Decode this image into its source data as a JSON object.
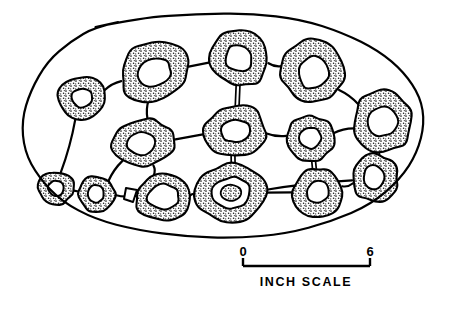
{
  "figure": {
    "outline_name": "specimen-outline",
    "stroke_color": "#000000",
    "fill_color": "#ffffff",
    "stipple_color": "#1a1a1a",
    "background": "#ffffff"
  },
  "scale": {
    "start_label": "0",
    "end_label": "6",
    "caption": "INCH  SCALE",
    "units": "inch",
    "min": 0,
    "max": 6
  },
  "chart_data": {
    "type": "scatter",
    "xlabel": "",
    "ylabel": "",
    "scale_units": "inch",
    "scale_min": 0,
    "scale_max": 6,
    "legend": [],
    "grid": false,
    "outline": [
      [
        96,
        28
      ],
      [
        140,
        18
      ],
      [
        196,
        13
      ],
      [
        252,
        14
      ],
      [
        300,
        20
      ],
      [
        344,
        32
      ],
      [
        378,
        50
      ],
      [
        404,
        72
      ],
      [
        420,
        98
      ],
      [
        424,
        124
      ],
      [
        418,
        152
      ],
      [
        400,
        180
      ],
      [
        372,
        204
      ],
      [
        332,
        222
      ],
      [
        286,
        233
      ],
      [
        236,
        238
      ],
      [
        186,
        237
      ],
      [
        138,
        231
      ],
      [
        96,
        220
      ],
      [
        62,
        202
      ],
      [
        38,
        178
      ],
      [
        25,
        150
      ],
      [
        22,
        120
      ],
      [
        30,
        90
      ],
      [
        48,
        62
      ],
      [
        70,
        42
      ]
    ],
    "rings": [
      {
        "id": "ring-nw-small",
        "cx": 82,
        "cy": 98,
        "rx": 25,
        "ry": 23,
        "hole_rx": 11,
        "hole_ry": 10,
        "rot": -8,
        "hole_dx": 0,
        "hole_dy": 0
      },
      {
        "id": "ring-n-left",
        "cx": 154,
        "cy": 71,
        "rx": 36,
        "ry": 30,
        "hole_rx": 18,
        "hole_ry": 14,
        "rot": -18,
        "hole_dx": 0,
        "hole_dy": 2
      },
      {
        "id": "ring-n-center",
        "cx": 240,
        "cy": 58,
        "rx": 30,
        "ry": 29,
        "hole_rx": 14,
        "hole_ry": 14,
        "rot": 10,
        "hole_dx": -1,
        "hole_dy": 0
      },
      {
        "id": "ring-n-right",
        "cx": 313,
        "cy": 72,
        "rx": 33,
        "ry": 32,
        "hole_rx": 15,
        "hole_ry": 17,
        "rot": 12,
        "hole_dx": 1,
        "hole_dy": 1
      },
      {
        "id": "ring-e-upper",
        "cx": 383,
        "cy": 122,
        "rx": 31,
        "ry": 31,
        "hole_rx": 15,
        "hole_ry": 15,
        "rot": 0,
        "hole_dx": 0,
        "hole_dy": 0
      },
      {
        "id": "ring-mid-left",
        "cx": 143,
        "cy": 143,
        "rx": 31,
        "ry": 25,
        "hole_rx": 14,
        "hole_ry": 12,
        "rot": -6,
        "hole_dx": -2,
        "hole_dy": 0
      },
      {
        "id": "ring-mid-center",
        "cx": 235,
        "cy": 131,
        "rx": 32,
        "ry": 25,
        "hole_rx": 15,
        "hole_ry": 11,
        "rot": -8,
        "hole_dx": 0,
        "hole_dy": 0
      },
      {
        "id": "ring-mid-right",
        "cx": 310,
        "cy": 138,
        "rx": 25,
        "ry": 23,
        "hole_rx": 12,
        "hole_ry": 11,
        "rot": 0,
        "hole_dx": 0,
        "hole_dy": 0
      },
      {
        "id": "ring-e-lower",
        "cx": 375,
        "cy": 178,
        "rx": 24,
        "ry": 24,
        "hole_rx": 11,
        "hole_ry": 12,
        "rot": 0,
        "hole_dx": -1,
        "hole_dy": -1
      },
      {
        "id": "ring-sw-tiny",
        "cx": 56,
        "cy": 188,
        "rx": 18,
        "ry": 17,
        "hole_rx": 8,
        "hole_ry": 8,
        "rot": 0,
        "hole_dx": 0,
        "hole_dy": 0
      },
      {
        "id": "ring-sw-small",
        "cx": 96,
        "cy": 194,
        "rx": 19,
        "ry": 18,
        "hole_rx": 8,
        "hole_ry": 9,
        "rot": 0,
        "hole_dx": 0,
        "hole_dy": 0
      },
      {
        "id": "ring-s-left",
        "cx": 163,
        "cy": 197,
        "rx": 28,
        "ry": 24,
        "hole_rx": 16,
        "hole_ry": 13,
        "rot": -5,
        "hole_dx": 0,
        "hole_dy": 0
      },
      {
        "id": "ring-s-center",
        "cx": 231,
        "cy": 193,
        "rx": 35,
        "ry": 30,
        "hole_rx": 20,
        "hole_ry": 16,
        "rot": -4,
        "hole_dx": 0,
        "hole_dy": 0,
        "double": true,
        "core_rx": 11,
        "core_ry": 8
      },
      {
        "id": "ring-s-right",
        "cx": 318,
        "cy": 192,
        "rx": 26,
        "ry": 25,
        "hole_rx": 12,
        "hole_ry": 11,
        "rot": 0,
        "hole_dx": 0,
        "hole_dy": 0
      },
      {
        "id": "ring-se-small",
        "cx": 300,
        "cy": 139,
        "rx": 0,
        "ry": 0,
        "hole_rx": 0,
        "hole_ry": 0,
        "rot": 0,
        "hole_dx": 0,
        "hole_dy": 0,
        "skip": true
      }
    ],
    "connections": [
      {
        "from": "ring-nw-small",
        "to": "ring-n-left",
        "kind": "single"
      },
      {
        "from": "ring-n-left",
        "to": "ring-n-center",
        "kind": "single"
      },
      {
        "from": "ring-n-center",
        "to": "ring-n-right",
        "kind": "single"
      },
      {
        "from": "ring-n-right",
        "to": "ring-e-upper",
        "kind": "single"
      },
      {
        "from": "ring-n-center",
        "to": "ring-mid-center",
        "kind": "double"
      },
      {
        "from": "ring-n-left",
        "to": "ring-mid-left",
        "kind": "single"
      },
      {
        "from": "ring-nw-small",
        "to": "ring-sw-tiny",
        "kind": "single"
      },
      {
        "from": "ring-mid-left",
        "to": "ring-mid-center",
        "kind": "single"
      },
      {
        "from": "ring-mid-left",
        "to": "ring-sw-small",
        "kind": "single"
      },
      {
        "from": "ring-mid-left",
        "to": "ring-s-left",
        "kind": "single"
      },
      {
        "from": "ring-sw-tiny",
        "to": "ring-sw-small",
        "kind": "single"
      },
      {
        "from": "ring-sw-small",
        "to": "ring-s-left",
        "kind": "single"
      },
      {
        "from": "ring-s-left",
        "to": "ring-s-center",
        "kind": "single"
      },
      {
        "from": "ring-mid-center",
        "to": "ring-s-center",
        "kind": "double"
      },
      {
        "from": "ring-mid-center",
        "to": "ring-mid-right",
        "kind": "single"
      },
      {
        "from": "ring-mid-right",
        "to": "ring-e-upper",
        "kind": "single"
      },
      {
        "from": "ring-mid-right",
        "to": "ring-s-right",
        "kind": "double"
      },
      {
        "from": "ring-e-upper",
        "to": "ring-e-lower",
        "kind": "double"
      },
      {
        "from": "ring-s-center",
        "to": "ring-e-lower",
        "kind": "single"
      },
      {
        "from": "ring-s-center",
        "to": "ring-s-right",
        "kind": "single"
      },
      {
        "from": "ring-s-right",
        "to": "ring-e-lower",
        "kind": "single"
      }
    ]
  }
}
